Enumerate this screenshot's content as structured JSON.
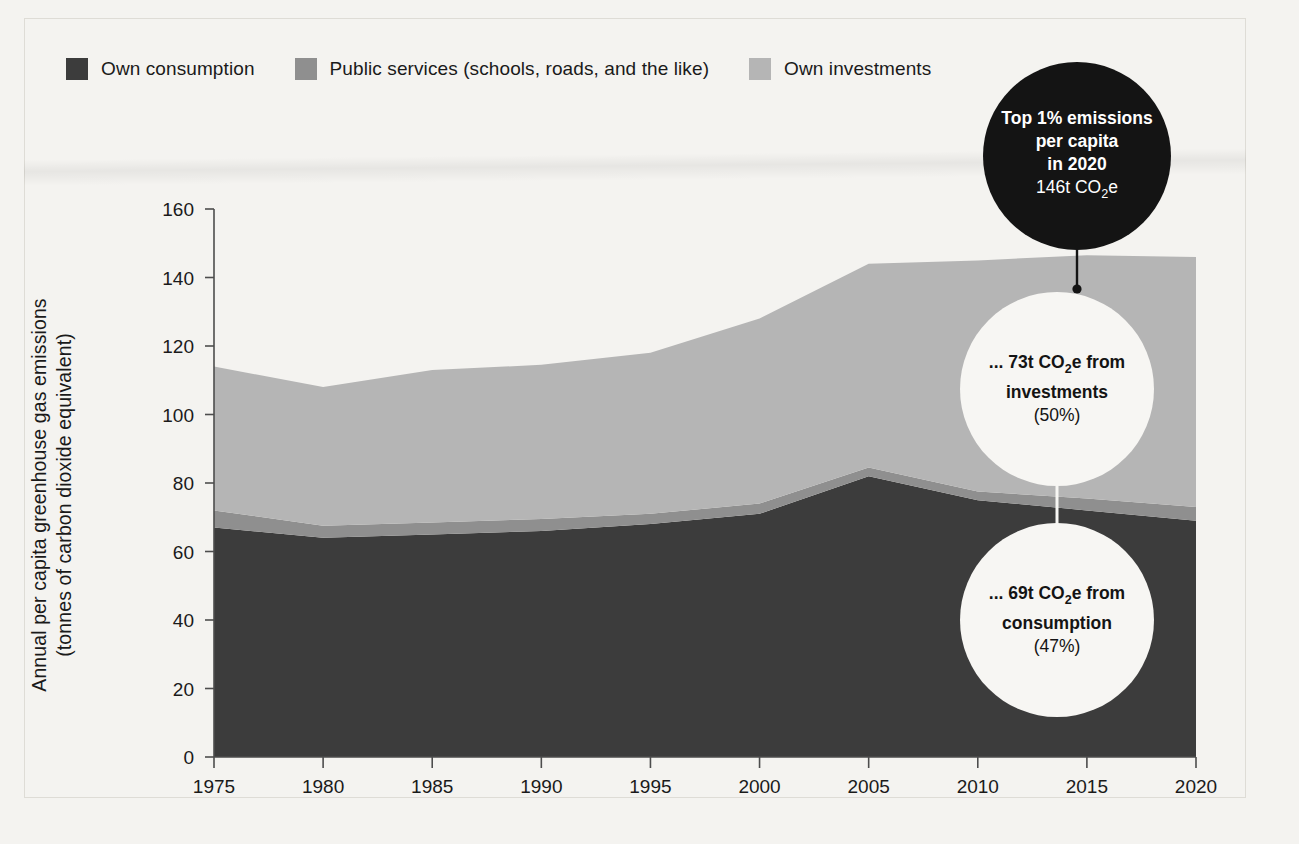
{
  "legend": {
    "items": [
      {
        "label": "Own consumption",
        "color": "#3c3c3c",
        "key": "own_consumption"
      },
      {
        "label": "Public services (schools, roads, and the like)",
        "color": "#8f8f8f",
        "key": "public_services"
      },
      {
        "label": "Own investments",
        "color": "#b5b5b5",
        "key": "own_investments"
      }
    ]
  },
  "axes": {
    "y_title_line1": "Annual per capita greenhouse gas emissions",
    "y_title_line2": "(tonnes of carbon dioxide equivalent)",
    "y_ticks": [
      "0",
      "20",
      "40",
      "60",
      "80",
      "100",
      "120",
      "140",
      "160"
    ],
    "x_ticks": [
      "1975",
      "1980",
      "1985",
      "1990",
      "1995",
      "2000",
      "2005",
      "2010",
      "2015",
      "2020"
    ]
  },
  "callouts": {
    "top": {
      "line1": "Top 1% emissions",
      "line2": "per capita",
      "line3": "in 2020",
      "line4_pre": "146t CO",
      "line4_sub": "2",
      "line4_post": "e",
      "background": "#141414",
      "text_color": "#ffffff"
    },
    "investments": {
      "line1_pre": "... 73t CO",
      "line1_sub": "2",
      "line1_post": "e from",
      "line2": "investments",
      "line3": "(50%)",
      "background": "#f7f6f3",
      "text_color": "#141414"
    },
    "consumption": {
      "line1_pre": "... 69t CO",
      "line1_sub": "2",
      "line1_post": "e from",
      "line2": "consumption",
      "line3": "(47%)",
      "background": "#f7f6f3",
      "text_color": "#141414"
    }
  },
  "chart_data": {
    "type": "area",
    "stacked": true,
    "title": "",
    "xlabel": "",
    "ylabel": "Annual per capita greenhouse gas emissions (tonnes of carbon dioxide equivalent)",
    "x": [
      1975,
      1980,
      1985,
      1990,
      1995,
      2000,
      2005,
      2010,
      2015,
      2020
    ],
    "xlim": [
      1975,
      2020
    ],
    "ylim": [
      0,
      160
    ],
    "grid": false,
    "legend_position": "top-left",
    "series": [
      {
        "name": "Own consumption",
        "color": "#3c3c3c",
        "values": [
          67,
          64,
          65,
          66,
          68,
          71,
          82,
          75,
          72,
          69
        ]
      },
      {
        "name": "Public services (schools, roads, and the like)",
        "color": "#8f8f8f",
        "values": [
          5,
          3.5,
          3.5,
          3.5,
          3,
          3,
          2.5,
          2.5,
          3.5,
          4
        ]
      },
      {
        "name": "Own investments",
        "color": "#b5b5b5",
        "values": [
          42,
          40.5,
          44.5,
          45,
          47,
          54,
          59.5,
          67.5,
          71,
          73
        ]
      }
    ],
    "totals": [
      114,
      108,
      113,
      114.5,
      118,
      128,
      144,
      145,
      146.5,
      146
    ],
    "annotations": [
      {
        "text": "Top 1% emissions per capita in 2020 146t CO2e",
        "x": 2020,
        "y": 146
      },
      {
        "text": "... 73t CO2e from investments (50%)",
        "x": 2020,
        "y": 73
      },
      {
        "text": "... 69t CO2e from consumption (47%)",
        "x": 2020,
        "y": 69
      }
    ]
  }
}
